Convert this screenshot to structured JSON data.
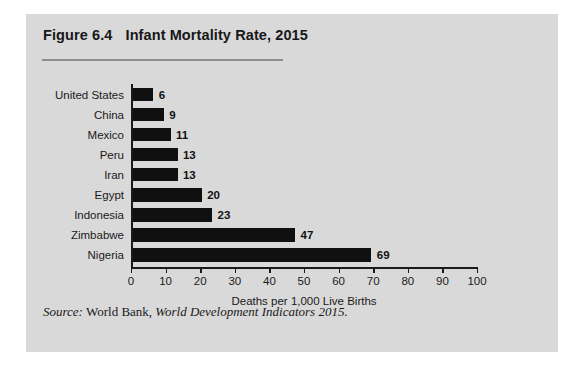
{
  "figure": {
    "number": "Figure 6.4",
    "title": "Infant Mortality Rate, 2015",
    "source_prefix": "Source:",
    "source_publisher": "World Bank,",
    "source_publication": "World Development Indicators 2015."
  },
  "chart_data": {
    "type": "bar",
    "orientation": "horizontal",
    "title": "Infant Mortality Rate, 2015",
    "categories": [
      "United States",
      "China",
      "Mexico",
      "Peru",
      "Iran",
      "Egypt",
      "Indonesia",
      "Zimbabwe",
      "Nigeria"
    ],
    "values": [
      6,
      9,
      11,
      13,
      13,
      20,
      23,
      47,
      69
    ],
    "xlabel": "Deaths per 1,000 Live Births",
    "ylabel": "",
    "xlim": [
      0,
      100
    ],
    "xticks": [
      0,
      10,
      20,
      30,
      40,
      50,
      60,
      70,
      80,
      90,
      100
    ],
    "xtick_labels": [
      "0",
      "10",
      "20",
      "30",
      "40",
      "50",
      "60",
      "70",
      "80",
      "90",
      "100"
    ],
    "grid": false,
    "legend": null,
    "bar_color": "#101010",
    "value_labels": [
      "6",
      "9",
      "11",
      "13",
      "13",
      "20",
      "23",
      "47",
      "69"
    ]
  },
  "colors": {
    "panel_background": "#d9d9d9",
    "page_background": "#ffffff",
    "bar": "#101010",
    "axis": "#1a1a1a",
    "rule": "#8d8d8d"
  }
}
